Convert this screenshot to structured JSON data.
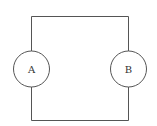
{
  "diagram": {
    "type": "circuit",
    "components": [
      {
        "id": "A",
        "label": "A",
        "shape": "circle"
      },
      {
        "id": "B",
        "label": "B",
        "shape": "circle"
      }
    ],
    "connections": [
      {
        "from": "A",
        "to": "B",
        "path": "top"
      },
      {
        "from": "A",
        "to": "B",
        "path": "bottom"
      }
    ],
    "colors": {
      "line": "#555555",
      "background": "#ffffff"
    }
  }
}
